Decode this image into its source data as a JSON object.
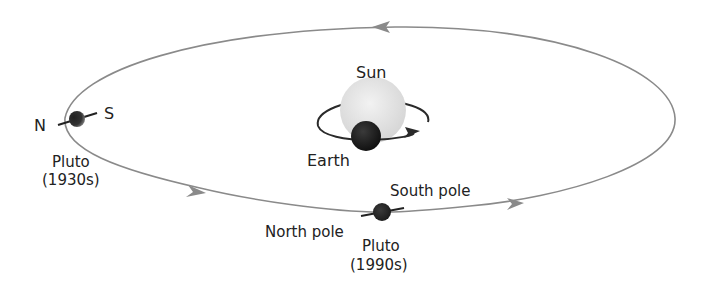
{
  "diagram": {
    "labels": {
      "sun": "Sun",
      "earth": "Earth",
      "pluto_1930_north": "N",
      "pluto_1930_south": "S",
      "pluto_1930_name": "Pluto",
      "pluto_1930_date": "(1930s)",
      "pluto_1990_south": "South pole",
      "pluto_1990_north": "North pole",
      "pluto_1990_name": "Pluto",
      "pluto_1990_date": "(1990s)"
    },
    "colors": {
      "orbit": "#8a8a8a",
      "sun": "#e2e2e2",
      "earth": "#1e1e1e",
      "earth_orbit": "#2a2a2a",
      "pluto": "#2b2b2b",
      "text": "#222222"
    }
  }
}
